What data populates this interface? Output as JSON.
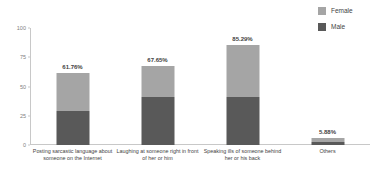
{
  "chart_data": {
    "type": "bar",
    "subtype": "stacked-bar",
    "title": "",
    "xlabel": "",
    "ylabel": "",
    "ylim": [
      0,
      100
    ],
    "yticks": [
      0,
      25,
      50,
      75,
      100
    ],
    "ytick_labels": [
      "0",
      "25",
      "50",
      "75",
      "100"
    ],
    "grid": false,
    "legend_position": "top-right",
    "categories": [
      "Posting sarcastic language about someone on the Internet",
      "Laughing at someone right in front of her or him",
      "Speaking ills of someone behind her or his back",
      "Others"
    ],
    "totals": [
      61.76,
      67.65,
      85.29,
      5.88
    ],
    "total_labels": [
      "61.76%",
      "67.65%",
      "85.29%",
      "5.88%"
    ],
    "series": [
      {
        "name": "Female",
        "color": "#a5a5a5",
        "values": [
          32.35,
          26.47,
          44.12,
          2.94
        ]
      },
      {
        "name": "Male",
        "color": "#595959",
        "values": [
          29.41,
          41.18,
          41.17,
          2.94
        ]
      }
    ]
  },
  "legend": {
    "items": [
      {
        "label": "Female",
        "color": "#a5a5a5"
      },
      {
        "label": "Male",
        "color": "#595959"
      }
    ]
  },
  "axis": {
    "y": {
      "ticks": [
        {
          "label": "100",
          "value": 100
        },
        {
          "label": "75",
          "value": 75
        },
        {
          "label": "50",
          "value": 50
        },
        {
          "label": "25",
          "value": 25
        },
        {
          "label": "0",
          "value": 0
        }
      ]
    }
  }
}
